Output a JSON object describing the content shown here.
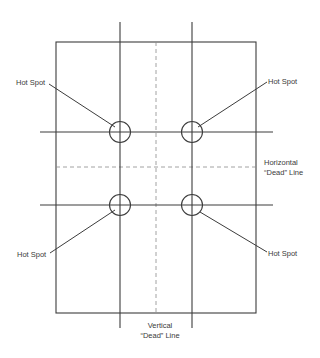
{
  "diagram": {
    "colors": {
      "line": "#3c3c3c",
      "dashed": "#8a8a8a",
      "text": "#3a3a3a",
      "background": "#ffffff"
    },
    "frame": {
      "x": 56,
      "y": 42,
      "width": 200,
      "height": 271
    },
    "grid_lines": {
      "vertical": [
        {
          "x": 120,
          "y1": 22,
          "y2": 328
        },
        {
          "x": 192,
          "y1": 22,
          "y2": 328
        }
      ],
      "horizontal": [
        {
          "y": 132,
          "x1": 40,
          "x2": 273
        },
        {
          "y": 205,
          "x1": 40,
          "x2": 273
        }
      ]
    },
    "dead_lines": {
      "vertical": {
        "x": 156,
        "y1": 42,
        "y2": 313,
        "label_line1": "Vertical",
        "label_line2": "“Dead” Line"
      },
      "horizontal": {
        "y": 167,
        "x1": 56,
        "x2": 256,
        "label_line1": "Horizontal",
        "label_line2": "“Dead” Line"
      }
    },
    "hot_spots": [
      {
        "cx": 120,
        "cy": 132,
        "r": 10,
        "label": "Hot Spot",
        "label_x": 16,
        "label_y": 78
      },
      {
        "cx": 192,
        "cy": 132,
        "r": 10,
        "label": "Hot Spot",
        "label_x": 268,
        "label_y": 78
      },
      {
        "cx": 120,
        "cy": 205,
        "r": 10,
        "label": "Hot Spot",
        "label_x": 16,
        "label_y": 250
      },
      {
        "cx": 192,
        "cy": 205,
        "r": 10,
        "label": "Hot Spot",
        "label_x": 268,
        "label_y": 250
      }
    ]
  }
}
